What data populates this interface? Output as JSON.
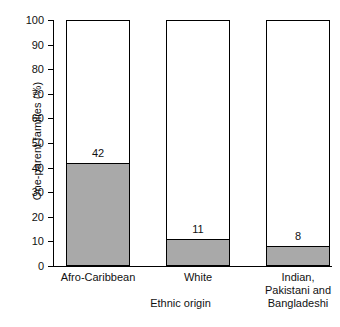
{
  "chart_data": {
    "type": "bar",
    "title": "",
    "subtitle": "",
    "xlabel": "Ethnic origin",
    "ylabel": "One-parent families (%)",
    "categories": [
      "Afro-Caribbean",
      "White",
      "Indian, Pakistani and Bangladeshi"
    ],
    "category_lines": [
      [
        "Afro-Caribbean"
      ],
      [
        "White"
      ],
      [
        "Indian,",
        "Pakistani and",
        "Bangladeshi"
      ]
    ],
    "values": [
      42,
      11,
      8
    ],
    "value_labels": [
      "42",
      "11",
      "8"
    ],
    "ylim": [
      0,
      100
    ],
    "yticks": [
      0,
      10,
      20,
      30,
      40,
      50,
      60,
      70,
      80,
      90,
      100
    ],
    "ytick_labels": [
      "0",
      "10",
      "20",
      "30",
      "40",
      "50",
      "60",
      "70",
      "80",
      "90",
      "100"
    ],
    "grid": false,
    "legend": false,
    "legend_position": "none",
    "bar_total_height": 100,
    "colors": {
      "bar_fill": "#a9a9a9",
      "bar_outline": "#000000",
      "bar_background": "#ffffff",
      "axis": "#000000",
      "text": "#111111",
      "page_background": "#ffffff"
    }
  }
}
